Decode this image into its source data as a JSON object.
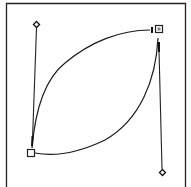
{
  "diagram": {
    "type": "bezier-path-editor",
    "stroke_color": "#1a1a1a",
    "background": "#ffffff",
    "anchors": [
      {
        "name": "anchor-bottom-left",
        "shape": "square",
        "selected": false
      },
      {
        "name": "anchor-top-right",
        "shape": "square",
        "selected": true
      }
    ],
    "handles": [
      {
        "name": "handle-top-left",
        "shape": "diamond-cross"
      },
      {
        "name": "handle-bottom-right",
        "shape": "diamond-cross"
      }
    ],
    "segments": [
      {
        "name": "curve-upper",
        "from": "anchor-bottom-left",
        "to": "anchor-top-right"
      },
      {
        "name": "curve-lower",
        "from": "anchor-bottom-left",
        "to": "anchor-top-right"
      }
    ]
  }
}
